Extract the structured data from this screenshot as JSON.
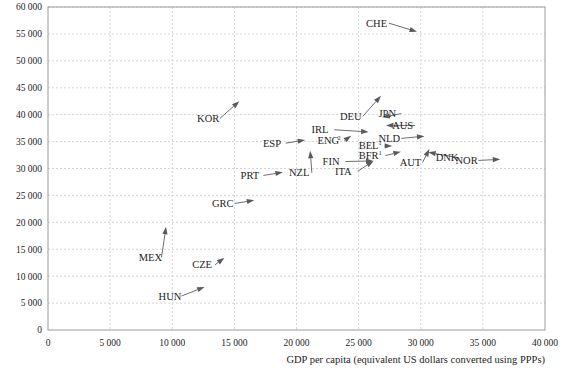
{
  "chart_data": {
    "type": "scatter",
    "title": "",
    "subtitle": "",
    "xlabel": "GDP per capita (equivalent US dollars converted using PPPs)",
    "ylabel": "",
    "xlim": [
      0,
      40000
    ],
    "ylim": [
      0,
      60000
    ],
    "xticks": [
      "0",
      "5 000",
      "10 000",
      "15 000",
      "20 000",
      "25 000",
      "30 000",
      "35 000",
      "40 000"
    ],
    "yticks": [
      "0",
      "5 000",
      "10 000",
      "15 000",
      "20 000",
      "25 000",
      "30 000",
      "35 000",
      "40 000",
      "45 000",
      "50 000",
      "55 000",
      "60 000"
    ],
    "xtick_values": [
      0,
      5000,
      10000,
      15000,
      20000,
      25000,
      30000,
      35000,
      40000
    ],
    "ytick_values": [
      0,
      5000,
      10000,
      15000,
      20000,
      25000,
      30000,
      35000,
      40000,
      45000,
      50000,
      55000,
      60000
    ],
    "grid": true,
    "legend": "none",
    "marker": "arrow",
    "points": [
      {
        "label": "CHE",
        "x": 29700,
        "y": 55400,
        "label_x": 25600,
        "label_y": 57000
      },
      {
        "label": "DEU",
        "x": 26800,
        "y": 43500,
        "label_x": 23500,
        "label_y": 39700
      },
      {
        "label": "JPN",
        "x": 26900,
        "y": 39500,
        "label_x": 26600,
        "label_y": 40200
      },
      {
        "label": "AUS",
        "x": 27200,
        "y": 38000,
        "label_x": 27700,
        "label_y": 38000
      },
      {
        "label": "KOR",
        "x": 15400,
        "y": 42500,
        "label_x": 12000,
        "label_y": 39300
      },
      {
        "label": "IRL",
        "x": 25800,
        "y": 36800,
        "label_x": 21200,
        "label_y": 37200
      },
      {
        "label": "ENG",
        "sup": "2",
        "x": 24400,
        "y": 36100,
        "label_x": 21700,
        "label_y": 35200
      },
      {
        "label": "NLD",
        "x": 30300,
        "y": 36000,
        "label_x": 26600,
        "label_y": 35600
      },
      {
        "label": "BEL",
        "sup": "1",
        "x": 27700,
        "y": 34200,
        "label_x": 25000,
        "label_y": 34200
      },
      {
        "label": "ESP",
        "x": 20700,
        "y": 35300,
        "label_x": 17300,
        "label_y": 34700
      },
      {
        "label": "BFR",
        "sup": "1",
        "x": 28400,
        "y": 33100,
        "label_x": 25000,
        "label_y": 32400
      },
      {
        "label": "AUT",
        "x": 30700,
        "y": 33600,
        "label_x": 28300,
        "label_y": 31100
      },
      {
        "label": "DNK",
        "x": 30600,
        "y": 33000,
        "label_x": 31200,
        "label_y": 32000
      },
      {
        "label": "NOR",
        "x": 36400,
        "y": 31700,
        "label_x": 32800,
        "label_y": 31500
      },
      {
        "label": "FIN",
        "x": 26200,
        "y": 31400,
        "label_x": 22100,
        "label_y": 31300
      },
      {
        "label": "ITA",
        "x": 26200,
        "y": 31400,
        "label_x": 23100,
        "label_y": 29500
      },
      {
        "label": "NZL",
        "x": 21100,
        "y": 33300,
        "label_x": 19400,
        "label_y": 29200
      },
      {
        "label": "PRT",
        "x": 18900,
        "y": 29300,
        "label_x": 15500,
        "label_y": 28700
      },
      {
        "label": "GRC",
        "x": 16600,
        "y": 24100,
        "label_x": 13200,
        "label_y": 23500
      },
      {
        "label": "MEX",
        "x": 9500,
        "y": 19200,
        "label_x": 7300,
        "label_y": 13500
      },
      {
        "label": "CZE",
        "x": 14200,
        "y": 13400,
        "label_x": 11600,
        "label_y": 12100
      },
      {
        "label": "HUN",
        "x": 12600,
        "y": 8000,
        "label_x": 8900,
        "label_y": 6300
      }
    ]
  },
  "colors": {
    "background": "#ffffff",
    "grid": "#c9c9c9",
    "frame": "#9a9a9a",
    "arrow": "#5a5a5a",
    "text": "#1d1d1d"
  }
}
